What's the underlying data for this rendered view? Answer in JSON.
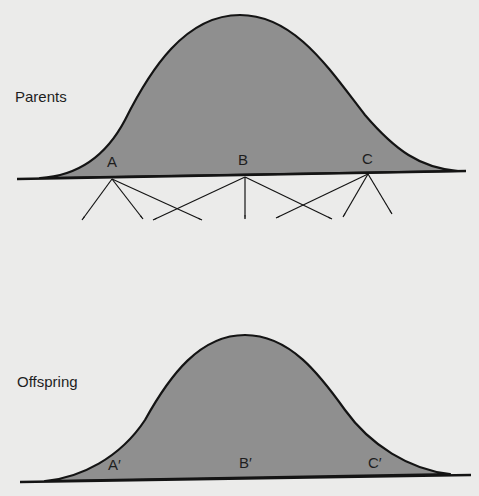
{
  "diagram": {
    "colors": {
      "background": "#ebebea",
      "curve_fill": "#8f8f8f",
      "stroke": "#141414",
      "text": "#1e1e1e"
    },
    "parents": {
      "label": "Parents",
      "points": [
        {
          "id": "A",
          "label": "A"
        },
        {
          "id": "B",
          "label": "B"
        },
        {
          "id": "C",
          "label": "C"
        }
      ],
      "arrows_per_point": 3
    },
    "offspring": {
      "label": "Offspring",
      "points": [
        {
          "id": "A2",
          "label": "A′"
        },
        {
          "id": "B2",
          "label": "B′"
        },
        {
          "id": "C2",
          "label": "C′"
        }
      ]
    }
  }
}
